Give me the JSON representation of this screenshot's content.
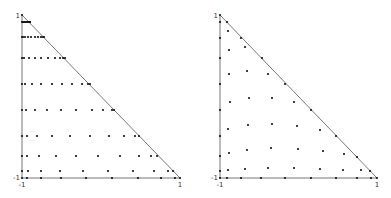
{
  "figure": {
    "background": "#ffffff",
    "line_color": "#777777",
    "dot_color": "#111111"
  },
  "plots": [
    {
      "name": "collapsed-tensor-grid",
      "frame": {
        "x0": 22,
        "y0": 178,
        "x1": 180,
        "y1": 15
      },
      "tick_labels": {
        "y_top": "1",
        "y_bottom": "-1",
        "x_left": "-1",
        "x_right": "1"
      },
      "rows_px": [
        {
          "y": 178,
          "xs": [
            22,
            27,
            41,
            61,
            86,
            112,
            138,
            161,
            175,
            180
          ]
        },
        {
          "y": 171,
          "xs": [
            22,
            28,
            41,
            60,
            83,
            108,
            133,
            154,
            168,
            173
          ]
        },
        {
          "y": 156,
          "xs": [
            22,
            27,
            39,
            56,
            76,
            98,
            120,
            139,
            151,
            157
          ]
        },
        {
          "y": 136,
          "xs": [
            22,
            27,
            37,
            52,
            70,
            90,
            109,
            124,
            135,
            139
          ]
        },
        {
          "y": 110,
          "xs": [
            22,
            26,
            35,
            47,
            61,
            76,
            92,
            103,
            112,
            114
          ]
        },
        {
          "y": 84,
          "xs": [
            22,
            25,
            32,
            41,
            52,
            62,
            72,
            82,
            88,
            90
          ]
        },
        {
          "y": 58,
          "xs": [
            22,
            24,
            29,
            35,
            41,
            48,
            55,
            60,
            63,
            65
          ]
        },
        {
          "y": 37,
          "xs": [
            22,
            23,
            25,
            28,
            31,
            35,
            38,
            41,
            43,
            44
          ]
        },
        {
          "y": 22,
          "xs": [
            22,
            23,
            24,
            25,
            26,
            27,
            28,
            29,
            30,
            30
          ]
        },
        {
          "y": 15,
          "xs": [
            22
          ]
        }
      ]
    },
    {
      "name": "symmetric-nodal-set",
      "frame": {
        "x0": 220,
        "y0": 178,
        "x1": 377,
        "y1": 15
      },
      "tick_labels": {
        "y_top": "1",
        "y_bottom": "-1",
        "x_left": "-1",
        "x_right": "1"
      },
      "points_px": [
        [
          220,
          178
        ],
        [
          227,
          178
        ],
        [
          241,
          178
        ],
        [
          261,
          178
        ],
        [
          285,
          178
        ],
        [
          311,
          178
        ],
        [
          336,
          178
        ],
        [
          357,
          178
        ],
        [
          371,
          178
        ],
        [
          377,
          178
        ],
        [
          220,
          171
        ],
        [
          228,
          170
        ],
        [
          245,
          169
        ],
        [
          268,
          168
        ],
        [
          294,
          168
        ],
        [
          320,
          169
        ],
        [
          343,
          170
        ],
        [
          361,
          170
        ],
        [
          370,
          171
        ],
        [
          220,
          156
        ],
        [
          229,
          153
        ],
        [
          247,
          150
        ],
        [
          271,
          148
        ],
        [
          298,
          149
        ],
        [
          323,
          151
        ],
        [
          344,
          154
        ],
        [
          357,
          157
        ],
        [
          220,
          136
        ],
        [
          228,
          129
        ],
        [
          248,
          125
        ],
        [
          272,
          124
        ],
        [
          297,
          126
        ],
        [
          320,
          130
        ],
        [
          336,
          136
        ],
        [
          220,
          110
        ],
        [
          230,
          102
        ],
        [
          249,
          98
        ],
        [
          272,
          98
        ],
        [
          294,
          102
        ],
        [
          311,
          110
        ],
        [
          220,
          84
        ],
        [
          229,
          74
        ],
        [
          247,
          71
        ],
        [
          268,
          74
        ],
        [
          285,
          84
        ],
        [
          220,
          58
        ],
        [
          229,
          50
        ],
        [
          245,
          47
        ],
        [
          262,
          58
        ],
        [
          220,
          38
        ],
        [
          228,
          31
        ],
        [
          241,
          38
        ],
        [
          220,
          22
        ],
        [
          227,
          22
        ],
        [
          220,
          15
        ]
      ]
    }
  ]
}
